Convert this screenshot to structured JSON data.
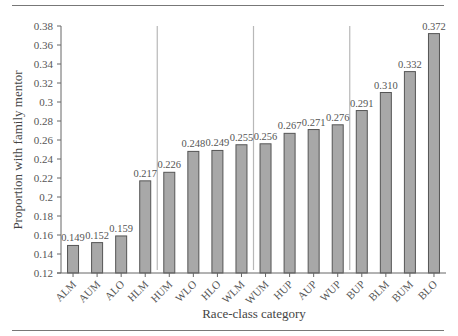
{
  "chart_data": {
    "type": "bar",
    "title": "",
    "xlabel": "Race-class category",
    "ylabel": "Proportion with family mentor",
    "ylim": [
      0.12,
      0.38
    ],
    "yticks": [
      0.12,
      0.14,
      0.16,
      0.18,
      0.2,
      0.22,
      0.24,
      0.26,
      0.28,
      0.3,
      0.32,
      0.34,
      0.36,
      0.38
    ],
    "ytick_labels": [
      "0.12",
      "0.14",
      "0.16",
      "0.18",
      "0.2",
      "0.22",
      "0.24",
      "0.26",
      "0.28",
      "0.3",
      "0.32",
      "0.34",
      "0.36",
      "0.38"
    ],
    "categories": [
      "ALM",
      "AUM",
      "ALO",
      "HLM",
      "HUM",
      "WLO",
      "HLO",
      "WLM",
      "WUM",
      "HUP",
      "AUP",
      "WUP",
      "BUP",
      "BLM",
      "BUM",
      "BLO"
    ],
    "values": [
      0.149,
      0.152,
      0.159,
      0.217,
      0.226,
      0.248,
      0.249,
      0.255,
      0.256,
      0.267,
      0.271,
      0.276,
      0.291,
      0.31,
      0.332,
      0.372
    ],
    "value_labels": [
      "0.149",
      "0.152",
      "0.159",
      "0.217",
      "0.226",
      "0.248",
      "0.249",
      "0.255",
      "0.256",
      "0.267",
      "0.271",
      "0.276",
      "0.291",
      "0.310",
      "0.332",
      "0.372"
    ],
    "group_dividers_after_index": [
      3,
      7,
      11
    ],
    "grid": false,
    "legend": null,
    "colors": {
      "bar_fill": "#a8a8a8",
      "bar_stroke": "#555555",
      "divider": "#b8b8b8",
      "axis": "#666666"
    }
  }
}
